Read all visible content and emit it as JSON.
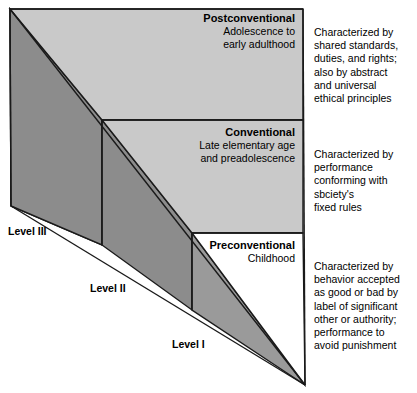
{
  "figure": {
    "title_hidden": "",
    "colors": {
      "level_three_fill": "#8c8c8c",
      "level_two_fill": "#8c8c8c",
      "level_one_fill": "#9a9a9a",
      "postconventional_fill": "#c9c9c9",
      "conventional_fill": "#c9c9c9",
      "preconventional_fill": "#ffffff",
      "outline": "#1a1a1a",
      "text": "#000000",
      "background": "#ffffff"
    }
  },
  "stages": [
    {
      "name": "Postconventional",
      "age_line_1": "Adolescence to",
      "age_line_2": "early adulthood",
      "description_lines": [
        "Characterized by",
        "shared standards,",
        "duties, and rights;",
        "also by abstract",
        "and universal",
        "ethical principles"
      ]
    },
    {
      "name": "Conventional",
      "age_line_1": "Late elementary age",
      "age_line_2": "and preadolescence",
      "description_lines": [
        "Characterized by",
        "performance",
        "conforming with",
        "sbciety's",
        "fixed rules"
      ]
    },
    {
      "name": "Preconventional",
      "age_line_1": "Childhood",
      "age_line_2": "",
      "description_lines": [
        "Characterized by",
        "behavior accepted",
        "as good or bad by",
        "label of significant",
        "other or authority;",
        "performance to",
        "avoid punishment"
      ]
    }
  ],
  "levels": [
    {
      "label": "Level III"
    },
    {
      "label": "Level II"
    },
    {
      "label": "Level I"
    }
  ]
}
